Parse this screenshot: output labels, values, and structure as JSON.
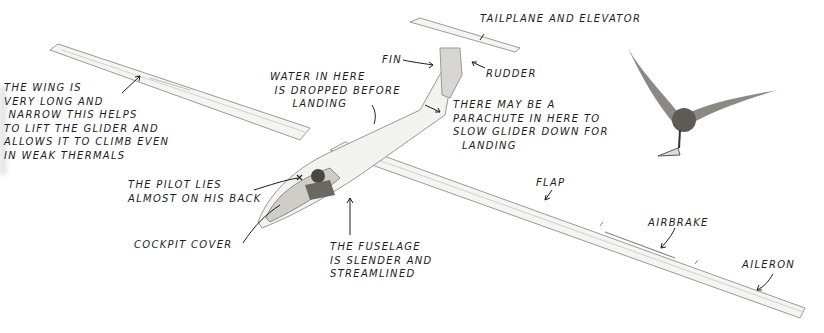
{
  "diagram": {
    "colors": {
      "background": "#ffffff",
      "airframe": "#f4f4f2",
      "outline": "#9a9a96",
      "text": "#1c1c1c",
      "bird": "#6e6a66"
    },
    "labels": {
      "wing": "THE WING IS\nVERY LONG AND\n NARROW THIS HELPS\nTO LIFT THE GLIDER AND\nALLOWS IT TO CLIMB EVEN\nIN WEAK THERMALS",
      "water": "WATER IN HERE\n IS DROPPED BEFORE\n     LANDING",
      "fin": "FIN",
      "tailplane": "TAILPLANE AND ELEVATOR",
      "rudder": "RUDDER",
      "parachute": "THERE MAY BE A\nPARACHUTE IN HERE TO\nSLOW GLIDER DOWN FOR\n  LANDING",
      "pilot": "THE PILOT LIES\nALMOST ON HIS BACK",
      "cockpit": "COCKPIT COVER",
      "fuselage": "THE FUSELAGE\nIS SLENDER AND\nSTREAMLINED",
      "flap": "FLAP",
      "airbrake": "AIRBRAKE",
      "aileron": "AILERON"
    }
  }
}
